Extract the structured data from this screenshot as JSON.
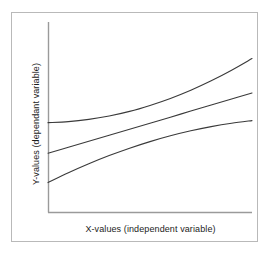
{
  "figure": {
    "background_color": "#ffffff",
    "frame_color": "#b9b9b9",
    "axis_color": "#9a9a9a",
    "curve_color": "#3a3a3a",
    "text_color": "#1c1c1c"
  },
  "chart_data": {
    "type": "line",
    "title": "",
    "subtitle": "",
    "xlabel": "X-values (independent variable)",
    "ylabel": "Y-values (dependant variable)",
    "xlim": [
      0,
      100
    ],
    "ylim": [
      0,
      100
    ],
    "grid": false,
    "legend": null,
    "legend_position": "none",
    "axis_ticks": {
      "x": [],
      "y": []
    },
    "annotations": [],
    "x": [
      0,
      10,
      20,
      30,
      40,
      50,
      60,
      70,
      80,
      90,
      100
    ],
    "series": [
      {
        "name": "accelerating",
        "shape": "concave-up",
        "values": [
          53.7,
          54.2,
          55.3,
          57.0,
          59.3,
          62.3,
          65.8,
          69.9,
          74.6,
          79.9,
          85.7
        ]
      },
      {
        "name": "linear",
        "shape": "near-linear",
        "values": [
          38.4,
          41.4,
          44.4,
          47.4,
          50.4,
          53.4,
          56.4,
          59.5,
          62.5,
          65.5,
          68.5
        ]
      },
      {
        "name": "decelerating",
        "shape": "concave-down",
        "values": [
          23.7,
          28.6,
          33.1,
          37.2,
          40.9,
          44.2,
          47.1,
          49.6,
          51.7,
          53.4,
          54.7
        ]
      }
    ]
  }
}
